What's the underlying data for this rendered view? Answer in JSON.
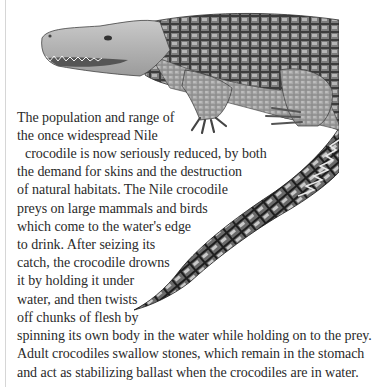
{
  "illustration": {
    "subject": "Nile crocodile",
    "style": "monochrome scientific illustration"
  },
  "body_text": {
    "lines": [
      "The population and range of",
      "the once widespread Nile",
      "crocodile is now seriously reduced, by both",
      "the demand for skins and the destruction",
      "of natural habitats. The Nile crocodile",
      "preys on large mammals and birds",
      "which come to the water's edge",
      "to drink. After seizing its",
      "catch, the crocodile drowns",
      "it by holding it under",
      "water, and then twists",
      "off chunks of flesh by",
      "spinning its own body in the water while holding on to the prey.",
      "Adult crocodiles swallow stones, which remain in the stomach",
      "and act as stabilizing ballast when the crocodiles are in water."
    ]
  }
}
